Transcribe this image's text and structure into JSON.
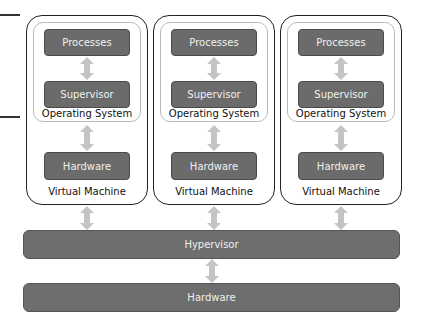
{
  "virtual_machines": [
    {
      "processes": "Processes",
      "supervisor": "Supervisor",
      "os_label": "Operating System",
      "hardware": "Hardware",
      "vm_label": "Virtual Machine"
    },
    {
      "processes": "Processes",
      "supervisor": "Supervisor",
      "os_label": "Operating System",
      "hardware": "Hardware",
      "vm_label": "Virtual Machine"
    },
    {
      "processes": "Processes",
      "supervisor": "Supervisor",
      "os_label": "Operating System",
      "hardware": "Hardware",
      "vm_label": "Virtual Machine"
    }
  ],
  "hypervisor": {
    "label": "Hypervisor"
  },
  "physical_hardware": {
    "label": "Hardware"
  },
  "colors": {
    "block_fill": "#6b6b6b",
    "arrow_fill": "#c4c4c4",
    "outline": "#222222"
  }
}
